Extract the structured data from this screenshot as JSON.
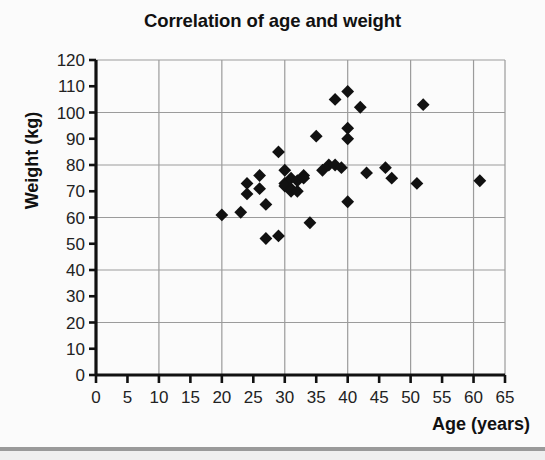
{
  "chart_data": {
    "type": "scatter",
    "title": "Correlation of age and weight",
    "xlabel": "Age (years)",
    "ylabel": "Weight (kg)",
    "xlim": [
      0,
      65
    ],
    "ylim": [
      0,
      120
    ],
    "xticks": [
      0,
      5,
      10,
      15,
      20,
      25,
      30,
      35,
      40,
      45,
      50,
      55,
      60,
      65
    ],
    "yticks": [
      0,
      10,
      20,
      30,
      40,
      50,
      60,
      70,
      80,
      90,
      100,
      110,
      120
    ],
    "grid": "major gridlines every 10 years on x and every 20 kg on y",
    "legend": "none",
    "marker": "filled black diamond",
    "points": [
      {
        "x": 20,
        "y": 61
      },
      {
        "x": 23,
        "y": 62
      },
      {
        "x": 24,
        "y": 73
      },
      {
        "x": 24,
        "y": 69
      },
      {
        "x": 26,
        "y": 76
      },
      {
        "x": 26,
        "y": 71
      },
      {
        "x": 27,
        "y": 65
      },
      {
        "x": 27,
        "y": 52
      },
      {
        "x": 29,
        "y": 85
      },
      {
        "x": 29,
        "y": 53
      },
      {
        "x": 30,
        "y": 78
      },
      {
        "x": 30,
        "y": 73
      },
      {
        "x": 30,
        "y": 72
      },
      {
        "x": 31,
        "y": 75
      },
      {
        "x": 31,
        "y": 71
      },
      {
        "x": 31,
        "y": 70
      },
      {
        "x": 32,
        "y": 74
      },
      {
        "x": 32,
        "y": 70
      },
      {
        "x": 33,
        "y": 76
      },
      {
        "x": 33,
        "y": 75
      },
      {
        "x": 34,
        "y": 58
      },
      {
        "x": 35,
        "y": 91
      },
      {
        "x": 36,
        "y": 78
      },
      {
        "x": 37,
        "y": 80
      },
      {
        "x": 38,
        "y": 105
      },
      {
        "x": 38,
        "y": 80
      },
      {
        "x": 39,
        "y": 79
      },
      {
        "x": 40,
        "y": 108
      },
      {
        "x": 40,
        "y": 94
      },
      {
        "x": 40,
        "y": 90
      },
      {
        "x": 40,
        "y": 66
      },
      {
        "x": 42,
        "y": 102
      },
      {
        "x": 43,
        "y": 77
      },
      {
        "x": 46,
        "y": 79
      },
      {
        "x": 47,
        "y": 75
      },
      {
        "x": 51,
        "y": 73
      },
      {
        "x": 52,
        "y": 103
      },
      {
        "x": 61,
        "y": 74
      }
    ]
  },
  "style": {
    "marker_color": "#111111",
    "axis_color": "#111111",
    "grid_color": "#9b9b9b",
    "text_color": "#111111",
    "background": "#fbfbfb"
  }
}
